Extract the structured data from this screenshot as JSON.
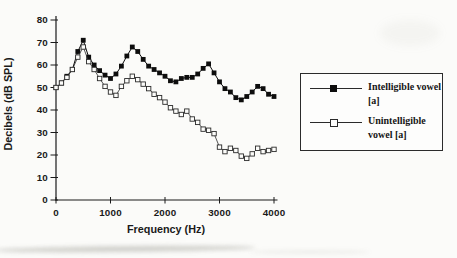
{
  "figure": {
    "background": "#fbfbf9",
    "axis_color": "#1a1a1a"
  },
  "chart_data": {
    "type": "line",
    "title": "",
    "xlabel": "Frequency (Hz)",
    "ylabel": "Decibels (dB SPL)",
    "xlim": [
      0,
      4000
    ],
    "ylim": [
      0,
      80
    ],
    "x_ticks": [
      0,
      1000,
      2000,
      3000,
      4000
    ],
    "y_ticks": [
      0,
      10,
      20,
      30,
      40,
      50,
      60,
      70,
      80
    ],
    "grid": false,
    "legend_position": "right-boxed",
    "x_hz": [
      0,
      100,
      200,
      300,
      400,
      500,
      600,
      700,
      800,
      900,
      1000,
      1100,
      1200,
      1300,
      1400,
      1500,
      1600,
      1700,
      1800,
      1900,
      2000,
      2100,
      2200,
      2300,
      2400,
      2500,
      2600,
      2700,
      2800,
      2900,
      3000,
      3100,
      3200,
      3300,
      3400,
      3500,
      3600,
      3700,
      3800,
      3900,
      4000
    ],
    "series": [
      {
        "name": "Intelligible vowel [a]",
        "marker": "filled-square",
        "color": "#0d0d0d",
        "values": [
          50,
          52,
          55,
          58,
          66,
          71,
          63.5,
          60,
          57.5,
          55.5,
          54,
          56,
          59.5,
          64,
          68,
          66,
          62.5,
          59.5,
          58,
          56.5,
          55,
          53,
          52.5,
          54,
          54.5,
          54.5,
          56,
          58.5,
          60.5,
          56.5,
          52.5,
          49.5,
          48,
          45.5,
          44.5,
          46,
          48,
          50.5,
          49.5,
          47,
          46
        ]
      },
      {
        "name": "Unintelligible vowel [a]",
        "marker": "open-square",
        "color": "#2a2a2a",
        "values": [
          50,
          52,
          54.5,
          58,
          63.5,
          68,
          61.5,
          58,
          54,
          50.5,
          48,
          46.5,
          50.5,
          53,
          55,
          53.5,
          51.5,
          49.5,
          47,
          45.5,
          43.5,
          41,
          39.5,
          38,
          39.5,
          36,
          34.5,
          31.5,
          31,
          29.5,
          23.5,
          21.5,
          23,
          22,
          19.5,
          18.5,
          20.5,
          23,
          21.5,
          22,
          22.5
        ]
      }
    ]
  },
  "legend": {
    "items": [
      {
        "label": "Intelligible vowel [a]",
        "lines": [
          "Intelligible vowel",
          "[a]"
        ],
        "marker": "filled-square"
      },
      {
        "label": "Unintelligible vowel [a]",
        "lines": [
          "Unintelligible",
          "vowel [a]"
        ],
        "marker": "open-square"
      }
    ]
  }
}
